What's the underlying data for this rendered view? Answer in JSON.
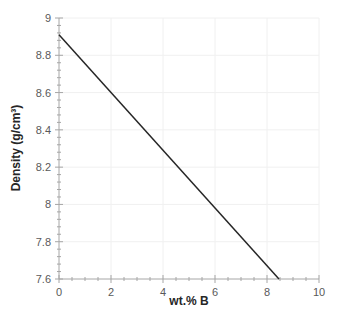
{
  "chart_data": {
    "type": "line",
    "title": "",
    "xlabel": "wt.% B",
    "ylabel": "Density (g/cm³)",
    "xlim": [
      0,
      10
    ],
    "ylim": [
      7.6,
      9
    ],
    "x_ticks": [
      "0",
      "2",
      "4",
      "6",
      "8",
      "10"
    ],
    "y_ticks": [
      "7.6",
      "7.8",
      "8",
      "8.2",
      "8.4",
      "8.6",
      "8.8",
      "9"
    ],
    "grid": true,
    "legend": null,
    "series": [
      {
        "name": "Density",
        "x": [
          0,
          8.46
        ],
        "y": [
          8.91,
          7.6
        ],
        "color": "#262626"
      }
    ]
  },
  "colors": {
    "axis": "#a6a6a6",
    "grid": "#f0f0f0",
    "line": "#262626"
  }
}
